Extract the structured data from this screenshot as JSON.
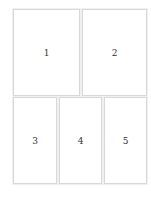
{
  "layout": {
    "rows": [
      {
        "panels": [
          {
            "label": "1"
          },
          {
            "label": "2"
          }
        ]
      },
      {
        "panels": [
          {
            "label": "3"
          },
          {
            "label": "4"
          },
          {
            "label": "5"
          }
        ]
      }
    ]
  },
  "colors": {
    "border": "#d8d8d8",
    "text": "#333333",
    "background": "#ffffff"
  }
}
